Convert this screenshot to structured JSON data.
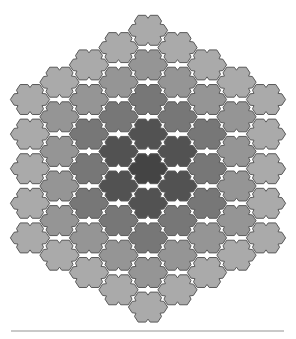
{
  "diagram": {
    "type": "hexagonal-tile-board",
    "shape": "hexagon-of-hexagons",
    "board_radius": 4,
    "tile_count": 61,
    "column_counts": [
      5,
      6,
      7,
      8,
      9,
      8,
      7,
      6,
      5
    ],
    "tile_style": "flat-top hexagon with notched edges",
    "ring_colors": [
      "#444444",
      "#525252",
      "#777777",
      "#959595",
      "#aaaaaa"
    ],
    "outline_color": "#5a5a5a",
    "baseline_color": "#c9c9c9"
  },
  "geometry": {
    "center_x": 148,
    "top_y": 13,
    "hex_radius": 19.6,
    "col_pitch": 29.5,
    "row_pitch": 34.6
  }
}
